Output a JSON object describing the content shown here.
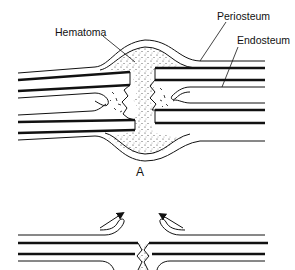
{
  "figure": {
    "panel_a": {
      "label": "A",
      "annotations": {
        "hematoma": "Hematoma",
        "periosteum": "Periosteum",
        "endosteum": "Endosteum"
      }
    },
    "panel_b": {
      "arrows": [
        "arrow-up-right",
        "arrow-up-left"
      ]
    }
  },
  "colors": {
    "ink": "#111111",
    "background": "#ffffff"
  }
}
